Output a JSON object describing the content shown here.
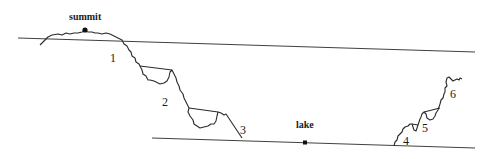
{
  "diagram": {
    "type": "topographic-profile",
    "labels": {
      "summit": "summit",
      "lake": "lake"
    },
    "points": {
      "summit": {
        "x": 85,
        "y": 30
      },
      "lake": {
        "x": 305,
        "y": 143
      }
    },
    "reference_lines": [
      {
        "name": "upper-reference-line",
        "from": [
          18,
          38
        ],
        "to": [
          475,
          52
        ]
      },
      {
        "name": "lower-reference-line",
        "from": [
          152,
          138
        ],
        "to": [
          475,
          148
        ]
      }
    ],
    "numbered_features": [
      {
        "id": "1",
        "label": "1",
        "x": 112,
        "y": 60
      },
      {
        "id": "2",
        "label": "2",
        "x": 163,
        "y": 104
      },
      {
        "id": "3",
        "label": "3",
        "x": 241,
        "y": 133
      },
      {
        "id": "4",
        "label": "4",
        "x": 404,
        "y": 144
      },
      {
        "id": "5",
        "label": "5",
        "x": 423,
        "y": 131
      },
      {
        "id": "6",
        "label": "6",
        "x": 450,
        "y": 98
      }
    ],
    "colors": {
      "line": "#2a2a2a",
      "background": "#ffffff"
    }
  }
}
